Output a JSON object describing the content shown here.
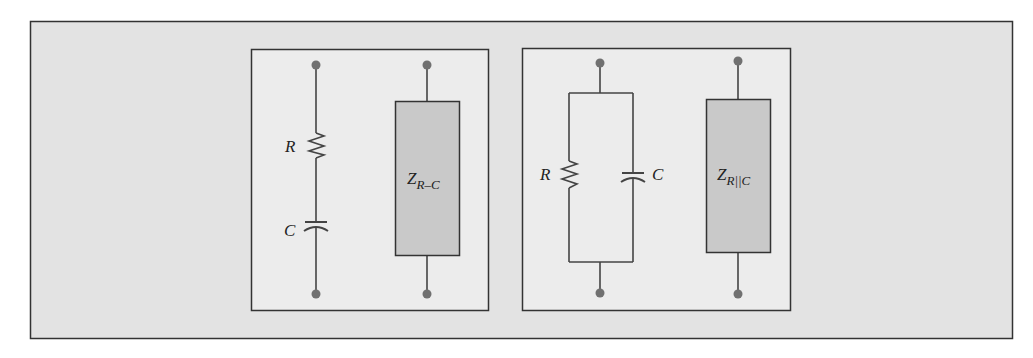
{
  "colors": {
    "frame_fill": "#e3e3e3",
    "panel_fill": "#ececec",
    "stroke": "#333333",
    "wire": "#444444",
    "terminal": "#707070",
    "impedance_fill": "#c9c9c9"
  },
  "diagram": {
    "left_panel": {
      "title": "Series R-C circuit",
      "resistor_label": "R",
      "capacitor_label": "C",
      "impedance": {
        "symbol": "Z",
        "subscript": "R–C"
      }
    },
    "right_panel": {
      "title": "Parallel R||C circuit",
      "resistor_label": "R",
      "capacitor_label": "C",
      "impedance": {
        "symbol": "Z",
        "subscript": "R||C"
      }
    }
  }
}
